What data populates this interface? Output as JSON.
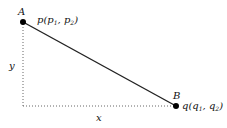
{
  "diagram": {
    "type": "distance-between-two-points",
    "points": [
      {
        "id": "A",
        "label": "A",
        "coord_label": "p(p1, p2)",
        "name": "p",
        "sub1": "1",
        "sub2": "2",
        "var": "p",
        "x": 23,
        "y": 22
      },
      {
        "id": "B",
        "label": "B",
        "coord_label": "q(q1, q2)",
        "name": "q",
        "sub1": "1",
        "sub2": "2",
        "var": "q",
        "x": 176,
        "y": 106
      }
    ],
    "axes": {
      "horizontal_label": "x",
      "vertical_label": "y"
    },
    "colors": {
      "segment": "#222222",
      "dotted": "#555555",
      "point": "#000000"
    }
  }
}
